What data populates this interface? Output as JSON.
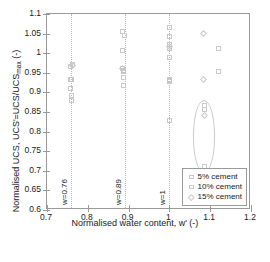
{
  "chart_data": {
    "type": "scatter",
    "title": "",
    "xlabel": "Normalised water content, w' (-)",
    "ylabel_parts": {
      "pre": "Normalised UCS, UCS'=UCS/UCS",
      "sub": "max",
      "post": " (-)"
    },
    "ylabel": "Normalised UCS, UCS'=UCS/UCS_max (-)",
    "xlim": [
      0.7,
      1.2
    ],
    "ylim": [
      0.6,
      1.1
    ],
    "xticks": [
      0.7,
      0.8,
      0.9,
      1.0,
      1.1,
      1.2
    ],
    "xtick_labels": [
      "0.7",
      "0.8",
      "0.9",
      "1",
      "1.1",
      "1.2"
    ],
    "yticks": [
      0.6,
      0.65,
      0.7,
      0.75,
      0.8,
      0.85,
      0.9,
      0.95,
      1.0,
      1.05,
      1.1
    ],
    "ytick_labels": [
      "0.6",
      "0.65",
      "0.7",
      "0.75",
      "0.8",
      "0.85",
      "0.9",
      "0.95",
      "1",
      "1.05",
      "1.1"
    ],
    "grid": "vertical-dotted-reference-lines",
    "legend_position": "lower-right",
    "legend": [
      {
        "label": "5% cement",
        "marker": "square",
        "color": "#c9c9c9"
      },
      {
        "label": "10% cement",
        "marker": "square",
        "color": "#c4c4c4"
      },
      {
        "label": "15% cement",
        "marker": "diamond",
        "color": "#c9c9c9"
      }
    ],
    "reference_lines": [
      {
        "x": 0.76,
        "label": "w=0.76",
        "style": "dotted"
      },
      {
        "x": 0.89,
        "label": "w=0.89",
        "style": "dotted"
      },
      {
        "x": 1.0,
        "label": "w=1",
        "style": "dotted"
      }
    ],
    "annotations": [
      {
        "type": "ellipse",
        "cx": 1.085,
        "cy": 0.787,
        "rx": 0.028,
        "ry": 0.093,
        "note": "highlighted low-strength group"
      }
    ],
    "series": [
      {
        "name": "5% cement",
        "marker": "square",
        "points": [
          {
            "x": 0.762,
            "y": 0.972
          },
          {
            "x": 0.758,
            "y": 0.966
          },
          {
            "x": 0.757,
            "y": 0.934
          },
          {
            "x": 0.76,
            "y": 0.932
          },
          {
            "x": 0.757,
            "y": 0.911
          },
          {
            "x": 0.76,
            "y": 0.893
          },
          {
            "x": 0.761,
            "y": 0.88
          },
          {
            "x": 0.885,
            "y": 1.055
          },
          {
            "x": 0.889,
            "y": 1.046
          },
          {
            "x": 0.886,
            "y": 1.007
          },
          {
            "x": 0.884,
            "y": 0.962
          },
          {
            "x": 0.888,
            "y": 0.953
          },
          {
            "x": 0.887,
            "y": 0.938
          },
          {
            "x": 0.888,
            "y": 0.918
          },
          {
            "x": 1.0,
            "y": 1.066
          },
          {
            "x": 1.0,
            "y": 1.042
          },
          {
            "x": 1.0,
            "y": 1.021
          },
          {
            "x": 1.0,
            "y": 1.013
          },
          {
            "x": 1.0,
            "y": 0.99
          },
          {
            "x": 1.0,
            "y": 0.934
          },
          {
            "x": 1.0,
            "y": 0.927
          },
          {
            "x": 1.0,
            "y": 0.828
          },
          {
            "x": 1.085,
            "y": 0.866
          },
          {
            "x": 1.085,
            "y": 0.857
          },
          {
            "x": 1.085,
            "y": 0.712
          },
          {
            "x": 1.12,
            "y": 1.012
          },
          {
            "x": 1.121,
            "y": 0.954
          }
        ]
      },
      {
        "name": "10% cement",
        "marker": "square",
        "points": [
          {
            "x": 0.76,
            "y": 0.934
          },
          {
            "x": 0.888,
            "y": 0.957
          },
          {
            "x": 1.0,
            "y": 0.93
          }
        ]
      },
      {
        "name": "15% cement",
        "marker": "diamond",
        "points": [
          {
            "x": 0.762,
            "y": 0.968
          },
          {
            "x": 0.886,
            "y": 0.96
          },
          {
            "x": 1.0,
            "y": 1.018
          },
          {
            "x": 1.083,
            "y": 1.05
          },
          {
            "x": 1.083,
            "y": 0.934
          },
          {
            "x": 1.085,
            "y": 0.842
          }
        ]
      }
    ]
  }
}
